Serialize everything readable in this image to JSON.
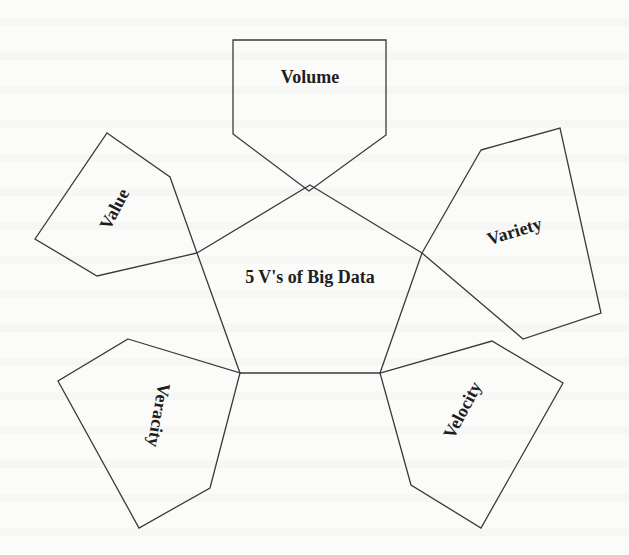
{
  "diagram": {
    "title": "5 V's of Big Data",
    "center": {
      "label": "5 V's of Big Data",
      "points": "310,185 422,253 380,373 240,373 197,253",
      "text_x": 310,
      "text_y": 279,
      "rotate": 0
    },
    "petals": [
      {
        "id": "volume",
        "label": "Volume",
        "points": "233,40 386,40 386,135 309,191 233,134",
        "text_x": 310,
        "text_y": 79,
        "rotate": 0
      },
      {
        "id": "value",
        "label": "Value",
        "points": "107,133 170,177 197,253 97,276 35,239",
        "text_x": 116,
        "text_y": 210,
        "rotate": -62
      },
      {
        "id": "variety",
        "label": "Variety",
        "points": "481,150 560,128 601,313 523,339 422,253",
        "text_x": 515,
        "text_y": 233,
        "rotate": -17
      },
      {
        "id": "veracity",
        "label": "Veracity",
        "points": "128,339 240,373 210,488 139,528 58,381",
        "text_x": 157,
        "text_y": 415,
        "rotate": 100
      },
      {
        "id": "velocity",
        "label": "Velocity",
        "points": "380,373 492,341 563,383 481,528 411,485",
        "text_x": 464,
        "text_y": 411,
        "rotate": -62
      }
    ]
  },
  "colors": {
    "stroke": "#3a3a3a",
    "text": "#1e1e1e",
    "background": "#fbfbfa"
  }
}
